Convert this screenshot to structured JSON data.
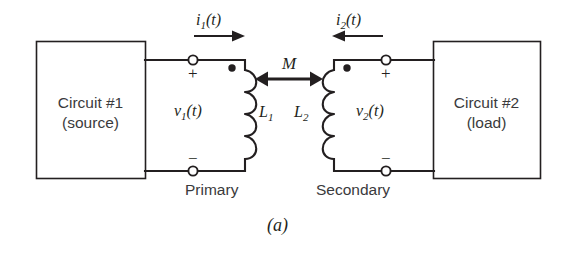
{
  "figure": {
    "caption": "(a)",
    "background_color": "#ffffff",
    "line_color": "#231f20",
    "text_color": "#3a3a3c"
  },
  "blocks": [
    {
      "id": "circuit-1",
      "line1": "Circuit #1",
      "line2": "(source)",
      "x": 36,
      "y": 41,
      "width": 109,
      "height": 137
    },
    {
      "id": "circuit-2",
      "line1": "Circuit #2",
      "line2": "(load)",
      "x": 433,
      "y": 41,
      "width": 107,
      "height": 137
    }
  ],
  "currents": [
    {
      "id": "i1",
      "label": "i",
      "sub": "1",
      "arg": "(t)",
      "direction": "right",
      "x": 196,
      "y": 16
    },
    {
      "id": "i2",
      "label": "i",
      "sub": "2",
      "arg": "(t)",
      "direction": "left",
      "x": 336,
      "y": 16
    }
  ],
  "voltages": [
    {
      "id": "v1",
      "label": "v",
      "sub": "1",
      "arg": "(t)",
      "x": 174,
      "y": 103,
      "plus": "+",
      "minus": "−"
    },
    {
      "id": "v2",
      "label": "v",
      "sub": "2",
      "arg": "(t)",
      "x": 356,
      "y": 103,
      "plus": "+",
      "minus": "−"
    }
  ],
  "inductors": [
    {
      "id": "L1",
      "label": "L",
      "sub": "1",
      "label_x": 252,
      "label_y": 104,
      "dot_side": "left",
      "winding_side": "right"
    },
    {
      "id": "L2",
      "label": "L",
      "sub": "2",
      "label_x": 296,
      "label_y": 104,
      "dot_side": "right",
      "winding_side": "left"
    }
  ],
  "mutual": {
    "id": "M",
    "label": "M",
    "label_x": 282,
    "label_y": 61,
    "arrow_y": 79,
    "arrow_x1": 257,
    "arrow_x2": 321
  },
  "winding_names": [
    {
      "id": "primary",
      "text": "Primary",
      "x": 220,
      "y": 186
    },
    {
      "id": "secondary",
      "text": "Secondary",
      "x": 356,
      "y": 186
    }
  ],
  "terminals": [
    {
      "id": "primary-top",
      "x": 193,
      "y": 60,
      "sign": "+"
    },
    {
      "id": "primary-bottom",
      "x": 193,
      "y": 171,
      "sign": "−"
    },
    {
      "id": "secondary-top",
      "x": 386,
      "y": 60,
      "sign": "+"
    },
    {
      "id": "secondary-bottom",
      "x": 386,
      "y": 171,
      "sign": "−"
    }
  ]
}
